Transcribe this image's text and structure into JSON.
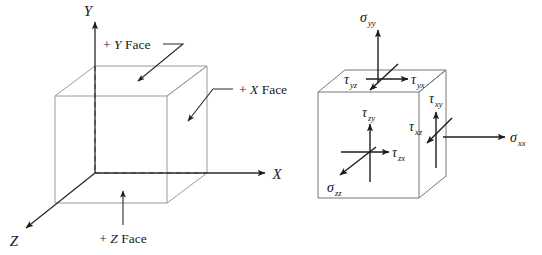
{
  "figure": {
    "background_color": "#ffffff",
    "line_color": "#9a9a9a",
    "arrow_color": "#1c1c1c",
    "text_color": "#1a1a1a"
  },
  "left_diagram": {
    "name": "coordinate-cube-faces",
    "axes": [
      {
        "id": "y",
        "label": "Y",
        "direction": "up"
      },
      {
        "id": "x",
        "label": "X",
        "direction": "right"
      },
      {
        "id": "z",
        "label": "Z",
        "direction": "down-left"
      }
    ],
    "face_callouts": [
      {
        "id": "y-face",
        "sign": "+",
        "axis": "Y",
        "word": "Face",
        "full": "+ Y Face"
      },
      {
        "id": "x-face",
        "sign": "+",
        "axis": "X",
        "word": "Face",
        "full": "+ X Face"
      },
      {
        "id": "z-face",
        "sign": "+",
        "axis": "Z",
        "word": "Face",
        "full": "+ Z Face"
      }
    ]
  },
  "right_diagram": {
    "name": "stress-component-cube",
    "components": [
      {
        "id": "sigma-yy",
        "symbol": "σ",
        "subscript": "yy",
        "type": "normal",
        "face": "+Y",
        "direction": "up"
      },
      {
        "id": "tau-yx",
        "symbol": "τ",
        "subscript": "yx",
        "type": "shear",
        "face": "+Y",
        "direction": "right"
      },
      {
        "id": "tau-yz",
        "symbol": "τ",
        "subscript": "yz",
        "type": "shear",
        "face": "+Y",
        "direction": "down-left"
      },
      {
        "id": "sigma-zz",
        "symbol": "σ",
        "subscript": "zz",
        "type": "normal",
        "face": "+Z",
        "direction": "down-left"
      },
      {
        "id": "tau-zx",
        "symbol": "τ",
        "subscript": "zx",
        "type": "shear",
        "face": "+Z",
        "direction": "right"
      },
      {
        "id": "tau-zy",
        "symbol": "τ",
        "subscript": "zy",
        "type": "shear",
        "face": "+Z",
        "direction": "up"
      },
      {
        "id": "sigma-xx",
        "symbol": "σ",
        "subscript": "xx",
        "type": "normal",
        "face": "+X",
        "direction": "right"
      },
      {
        "id": "tau-xy",
        "symbol": "τ",
        "subscript": "xy",
        "type": "shear",
        "face": "+X",
        "direction": "up"
      },
      {
        "id": "tau-xz",
        "symbol": "τ",
        "subscript": "xz",
        "type": "shear",
        "face": "+X",
        "direction": "down-left"
      }
    ]
  }
}
